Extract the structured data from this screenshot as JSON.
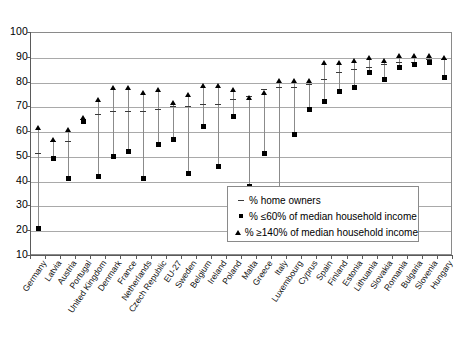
{
  "chart_data": {
    "type": "scatter",
    "title": "",
    "xlabel": "",
    "ylabel": "",
    "ylim": [
      10,
      100
    ],
    "ytick_step": 10,
    "yticks": [
      100,
      90,
      80,
      70,
      60,
      50,
      40,
      30,
      20,
      10
    ],
    "grid": true,
    "legend_position": "inside-bottom-right",
    "categories": [
      "Germany",
      "Latvia",
      "Austria",
      "Portugal",
      "United Kingdom",
      "Denmark",
      "France",
      "Netherlands",
      "Czech Republic",
      "EU-27",
      "Sweden",
      "Belgium",
      "Ireland",
      "Poland",
      "Malta",
      "Greece",
      "Italy",
      "Luxembourg",
      "Cyprus",
      "Spain",
      "Finland",
      "Estonia",
      "Lithuania",
      "Slovakia",
      "Romania",
      "Bulgaria",
      "Slovenia",
      "Hungary"
    ],
    "series": [
      {
        "name": "% home owners",
        "marker": "dash",
        "values": [
          51,
          56,
          56,
          65,
          67,
          68,
          68,
          68,
          69,
          70,
          70,
          71,
          71,
          73,
          74,
          77,
          78,
          78,
          79,
          81,
          84,
          85,
          86,
          87,
          88,
          88,
          89,
          89
        ]
      },
      {
        "name": "% ≤60% of median household income",
        "marker": "square",
        "values": [
          21,
          49,
          41,
          64,
          42,
          50,
          52,
          41,
          55,
          57,
          43,
          62,
          46,
          66,
          38,
          51,
          31,
          59,
          69,
          72,
          76,
          78,
          84,
          81,
          86,
          87,
          88,
          82
        ]
      },
      {
        "name": "% ≥140% of median household income",
        "marker": "triangle",
        "values": [
          61,
          56,
          60,
          65,
          72,
          77,
          77,
          75,
          76,
          71,
          74,
          78,
          78,
          76,
          73,
          75,
          80,
          80,
          80,
          87,
          87,
          88,
          89,
          88,
          90,
          90,
          90,
          89
        ]
      }
    ]
  },
  "legend": {
    "items": [
      {
        "marker": "dash-icon",
        "label": "% home owners"
      },
      {
        "marker": "square-icon",
        "label": "% ≤60% of median household income"
      },
      {
        "marker": "triangle-icon",
        "label": "% ≥140% of median household income"
      }
    ]
  },
  "colors": {
    "marker": "#000000",
    "stem": "#8b8b8b",
    "grid": "#a9a9a9",
    "axis": "#5a5a5a",
    "background": "#ffffff"
  }
}
